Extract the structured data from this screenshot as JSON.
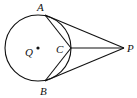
{
  "diagram": {
    "type": "geometry",
    "colors": {
      "stroke": "#111111",
      "background": "#ffffff"
    },
    "circle": {
      "center_label": "Q",
      "cx": 38,
      "cy": 48,
      "r": 33
    },
    "points": {
      "A": {
        "label": "A",
        "x": 45,
        "y": 15
      },
      "B": {
        "label": "B",
        "x": 45,
        "y": 81
      },
      "C": {
        "label": "C",
        "x": 71,
        "y": 48
      },
      "P": {
        "label": "P",
        "x": 124,
        "y": 48
      },
      "Q": {
        "label": "Q",
        "x": 38,
        "y": 48
      }
    },
    "segments": [
      "PA",
      "PB",
      "PC",
      "AC",
      "BC"
    ]
  }
}
